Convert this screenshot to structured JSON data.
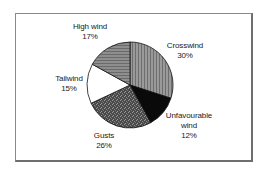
{
  "chart_data": {
    "type": "pie",
    "title": "",
    "start_angle_deg": 0,
    "direction": "clockwise",
    "slices": [
      {
        "label": "Crosswind",
        "value": 30,
        "display": "30%",
        "fill": "#8c8c8c",
        "pattern": "vertical-lines"
      },
      {
        "label": "Unfavourable wind",
        "value": 12,
        "display": "12%",
        "fill": "#0a0a0a",
        "pattern": "solid"
      },
      {
        "label": "Gusts",
        "value": 26,
        "display": "26%",
        "fill": "#5a5a5a",
        "pattern": "dense-texture"
      },
      {
        "label": "Tailwind",
        "value": 15,
        "display": "15%",
        "fill": "#ffffff",
        "pattern": "solid"
      },
      {
        "label": "High wind",
        "value": 17,
        "display": "17%",
        "fill": "#7e7e7e",
        "pattern": "horizontal-lines"
      }
    ],
    "legend": "none",
    "data_labels": "outside"
  },
  "labels": {
    "high_wind": {
      "name": "High wind",
      "pct": "17%"
    },
    "crosswind": {
      "name": "Crosswind",
      "pct": "30%"
    },
    "tailwind": {
      "name": "Tailwind",
      "pct": "15%"
    },
    "unfavourable": {
      "name1": "Unfavourable",
      "name2": "wind",
      "pct": "12%"
    },
    "gusts": {
      "name": "Gusts",
      "pct": "26%"
    }
  }
}
